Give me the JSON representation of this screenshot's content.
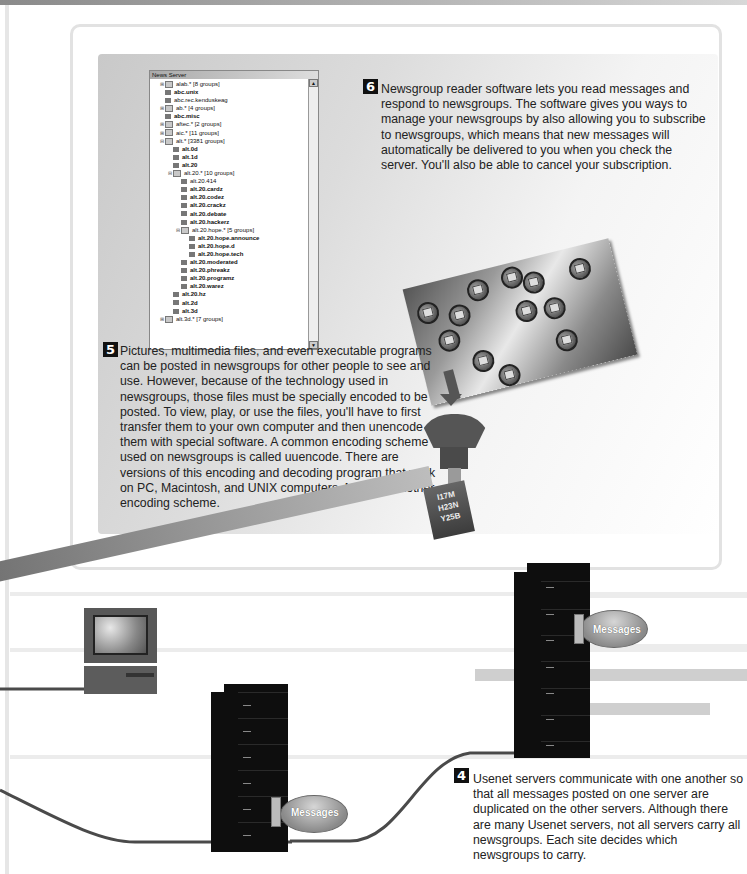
{
  "news_server_window": {
    "title": "News Server",
    "tree": [
      {
        "indent": 1,
        "expander": "+",
        "icon": "folder",
        "label": "alab.* [8 groups]",
        "bold": false
      },
      {
        "indent": 1,
        "expander": "",
        "icon": "newsgroup",
        "label": "abc.unix",
        "bold": true
      },
      {
        "indent": 1,
        "expander": "",
        "icon": "newsgroup",
        "label": "abc.rec.kenduskeag",
        "bold": false
      },
      {
        "indent": 1,
        "expander": "+",
        "icon": "folder",
        "label": "ab.* [4 groups]",
        "bold": false
      },
      {
        "indent": 1,
        "expander": "",
        "icon": "newsgroup",
        "label": "abc.misc",
        "bold": true
      },
      {
        "indent": 1,
        "expander": "+",
        "icon": "folder",
        "label": "aftec.* [2 groups]",
        "bold": false
      },
      {
        "indent": 1,
        "expander": "+",
        "icon": "folder",
        "label": "aic.* [11 groups]",
        "bold": false
      },
      {
        "indent": 1,
        "expander": "-",
        "icon": "folder",
        "label": "alt.* [3381 groups]",
        "bold": false
      },
      {
        "indent": 2,
        "expander": "",
        "icon": "newsgroup",
        "label": "alt.0d",
        "bold": true
      },
      {
        "indent": 2,
        "expander": "",
        "icon": "newsgroup",
        "label": "alt.1d",
        "bold": true
      },
      {
        "indent": 2,
        "expander": "",
        "icon": "newsgroup",
        "label": "alt.20",
        "bold": true
      },
      {
        "indent": 2,
        "expander": "-",
        "icon": "folder",
        "label": "alt.20.* [10 groups]",
        "bold": false
      },
      {
        "indent": 3,
        "expander": "",
        "icon": "newsgroup",
        "label": "alt.20.414",
        "bold": false
      },
      {
        "indent": 3,
        "expander": "",
        "icon": "newsgroup",
        "label": "alt.20.cardz",
        "bold": true
      },
      {
        "indent": 3,
        "expander": "",
        "icon": "newsgroup",
        "label": "alt.20.codez",
        "bold": true
      },
      {
        "indent": 3,
        "expander": "",
        "icon": "newsgroup",
        "label": "alt.20.crackz",
        "bold": true
      },
      {
        "indent": 3,
        "expander": "",
        "icon": "newsgroup",
        "label": "alt.20.debate",
        "bold": true
      },
      {
        "indent": 3,
        "expander": "",
        "icon": "newsgroup",
        "label": "alt.20.hackerz",
        "bold": true
      },
      {
        "indent": 3,
        "expander": "-",
        "icon": "folder",
        "label": "alt.20.hope.* [5 groups]",
        "bold": false
      },
      {
        "indent": 4,
        "expander": "",
        "icon": "newsgroup",
        "label": "alt.20.hope.announce",
        "bold": true
      },
      {
        "indent": 4,
        "expander": "",
        "icon": "newsgroup",
        "label": "alt.20.hope.d",
        "bold": true
      },
      {
        "indent": 4,
        "expander": "",
        "icon": "newsgroup",
        "label": "alt.20.hope.tech",
        "bold": true
      },
      {
        "indent": 3,
        "expander": "",
        "icon": "newsgroup",
        "label": "alt.20.moderated",
        "bold": true
      },
      {
        "indent": 3,
        "expander": "",
        "icon": "newsgroup",
        "label": "alt.20.phreakz",
        "bold": true
      },
      {
        "indent": 3,
        "expander": "",
        "icon": "newsgroup",
        "label": "alt.20.programz",
        "bold": true
      },
      {
        "indent": 3,
        "expander": "",
        "icon": "newsgroup",
        "label": "alt.20.warez",
        "bold": true
      },
      {
        "indent": 2,
        "expander": "",
        "icon": "newsgroup",
        "label": "alt.20.hz",
        "bold": true
      },
      {
        "indent": 2,
        "expander": "",
        "icon": "newsgroup",
        "label": "alt.2d",
        "bold": true
      },
      {
        "indent": 2,
        "expander": "",
        "icon": "newsgroup",
        "label": "alt.3d",
        "bold": true
      },
      {
        "indent": 1,
        "expander": "+",
        "icon": "folder",
        "label": "alt.3d.* [7 groups]",
        "bold": false
      }
    ]
  },
  "steps": {
    "step6": {
      "number": "6",
      "text": "Newsgroup reader software lets you read messages and respond to newsgroups. The software gives you ways to manage your newsgroups by also allowing you to subscribe to newsgroups, which means that new messages will automatically be delivered to you when you check the server. You'll also be able to cancel your subscription."
    },
    "step5": {
      "number": "5",
      "text": "Pictures, multimedia files, and even executable programs can be posted in newsgroups for other people to see and use. However, because of the technology used in newsgroups, those files must be specially encoded to be posted. To view, play, or use the files, you'll have to first transfer them to your own computer and then unencode them with special software. A common encoding scheme used on newsgroups is called uuencode. There are versions of this encoding and decoding program that work on PC, Macintosh, and UNIX computers. MIME is another encoding scheme."
    },
    "step4": {
      "number": "4",
      "text": "Usenet servers communicate with one another so that all messages posted on one server are duplicated on the other servers. Although there are many Usenet servers, not all servers carry all newsgroups. Each site decides which newsgroups to carry."
    }
  },
  "encoded_box": {
    "lines": [
      "I17M",
      "H23N",
      "Y25B"
    ]
  },
  "beam_label": "\"Check out this picture\"",
  "disks": [
    {
      "label": "Messages"
    },
    {
      "label": "Messages"
    }
  ],
  "colors": {
    "server": "#0e0e0e",
    "cable": "#4a4a4a",
    "badge": "#111111",
    "panel_border": "#e2e2e2"
  }
}
